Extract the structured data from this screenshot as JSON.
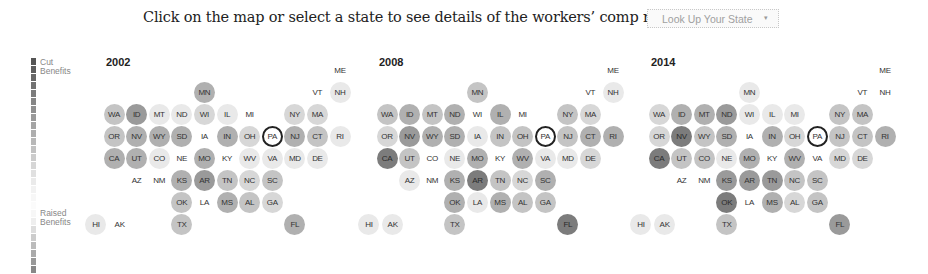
{
  "prompt": {
    "text": "Click on the map or select a state to see details of the workers’ comp reforms:",
    "select_label": "Look Up Your State",
    "select_arrow": "▾"
  },
  "legend": {
    "top_label": "Cut Benefits",
    "bottom_label": "Raised Benefits",
    "segments": [
      "#555",
      "#5e5e5e",
      "#686868",
      "#727272",
      "#7c7c7c",
      "#868686",
      "#909090",
      "#9a9a9a",
      "#a4a4a4",
      "#aeaeae",
      "#b8b8b8",
      "#c2c2c2",
      "#cccccc",
      "#d6d6d6",
      "#e0e0e0",
      "#eaeaea",
      "#f2f2f2",
      "#f7f7f7",
      "#fbfbfb",
      "#f7f7f7",
      "#eeeeee",
      "#dddddd",
      "#cccccc",
      "#bbbbbb",
      "#aaaaaa",
      "#999999",
      "#888888"
    ]
  },
  "shades": [
    "#ffffff",
    "#e9e9e9",
    "#d7d7d7",
    "#c4c4c4",
    "#b0b0b0",
    "#9a9a9a",
    "#7c7c7c",
    "#5f5f5f"
  ],
  "selected_state": "PA",
  "chart_data": {
    "type": "heatmap",
    "legend": {
      "low": "Cut Benefits",
      "high": "Raised Benefits"
    },
    "scale_note": "shade 0 = no change/light, higher = darker (larger change)",
    "layout": [
      {
        "state": "ME",
        "col": 10,
        "row": 0
      },
      {
        "state": "MN",
        "col": 4,
        "row": 1
      },
      {
        "state": "VT",
        "col": 9,
        "row": 1
      },
      {
        "state": "NH",
        "col": 10,
        "row": 1
      },
      {
        "state": "WA",
        "col": 0,
        "row": 2
      },
      {
        "state": "ID",
        "col": 1,
        "row": 2
      },
      {
        "state": "MT",
        "col": 2,
        "row": 2
      },
      {
        "state": "ND",
        "col": 3,
        "row": 2
      },
      {
        "state": "WI",
        "col": 4,
        "row": 2
      },
      {
        "state": "IL",
        "col": 5,
        "row": 2
      },
      {
        "state": "MI",
        "col": 6,
        "row": 2
      },
      {
        "state": "NY",
        "col": 8,
        "row": 2
      },
      {
        "state": "MA",
        "col": 9,
        "row": 2
      },
      {
        "state": "OR",
        "col": 0,
        "row": 3
      },
      {
        "state": "NV",
        "col": 1,
        "row": 3
      },
      {
        "state": "WY",
        "col": 2,
        "row": 3
      },
      {
        "state": "SD",
        "col": 3,
        "row": 3
      },
      {
        "state": "IA",
        "col": 4,
        "row": 3
      },
      {
        "state": "IN",
        "col": 5,
        "row": 3
      },
      {
        "state": "OH",
        "col": 6,
        "row": 3
      },
      {
        "state": "PA",
        "col": 7,
        "row": 3
      },
      {
        "state": "NJ",
        "col": 8,
        "row": 3
      },
      {
        "state": "CT",
        "col": 9,
        "row": 3
      },
      {
        "state": "RI",
        "col": 10,
        "row": 3
      },
      {
        "state": "CA",
        "col": 0,
        "row": 4
      },
      {
        "state": "UT",
        "col": 1,
        "row": 4
      },
      {
        "state": "CO",
        "col": 2,
        "row": 4
      },
      {
        "state": "NE",
        "col": 3,
        "row": 4
      },
      {
        "state": "MO",
        "col": 4,
        "row": 4
      },
      {
        "state": "KY",
        "col": 5,
        "row": 4
      },
      {
        "state": "WV",
        "col": 6,
        "row": 4
      },
      {
        "state": "VA",
        "col": 7,
        "row": 4
      },
      {
        "state": "MD",
        "col": 8,
        "row": 4
      },
      {
        "state": "DE",
        "col": 9,
        "row": 4
      },
      {
        "state": "AZ",
        "col": 1,
        "row": 5
      },
      {
        "state": "NM",
        "col": 2,
        "row": 5
      },
      {
        "state": "KS",
        "col": 3,
        "row": 5
      },
      {
        "state": "AR",
        "col": 4,
        "row": 5
      },
      {
        "state": "TN",
        "col": 5,
        "row": 5
      },
      {
        "state": "NC",
        "col": 6,
        "row": 5
      },
      {
        "state": "SC",
        "col": 7,
        "row": 5
      },
      {
        "state": "OK",
        "col": 3,
        "row": 6
      },
      {
        "state": "LA",
        "col": 4,
        "row": 6
      },
      {
        "state": "MS",
        "col": 5,
        "row": 6
      },
      {
        "state": "AL",
        "col": 6,
        "row": 6
      },
      {
        "state": "GA",
        "col": 7,
        "row": 6
      },
      {
        "state": "HI",
        "col": -0.8,
        "row": 7
      },
      {
        "state": "AK",
        "col": 0.25,
        "row": 7
      },
      {
        "state": "TX",
        "col": 3,
        "row": 7
      },
      {
        "state": "FL",
        "col": 8,
        "row": 7
      }
    ],
    "years": [
      {
        "year": "2002",
        "values": {
          "ME": 0,
          "MN": 4,
          "VT": 0,
          "NH": 1,
          "WA": 3,
          "ID": 5,
          "MT": 1,
          "ND": 1,
          "WI": 2,
          "IL": 1,
          "MI": 0,
          "NY": 2,
          "MA": 2,
          "OR": 3,
          "NV": 4,
          "WY": 4,
          "SD": 4,
          "IA": 0,
          "IN": 4,
          "OH": 2,
          "PA": 0,
          "NJ": 4,
          "CT": 3,
          "RI": 1,
          "CA": 4,
          "UT": 4,
          "CO": 1,
          "NE": 0,
          "MO": 4,
          "KY": 0,
          "WV": 1,
          "VA": 1,
          "MD": 1,
          "DE": 1,
          "AZ": 0,
          "NM": 0,
          "KS": 4,
          "AR": 5,
          "TN": 3,
          "NC": 2,
          "SC": 3,
          "OK": 3,
          "LA": 0,
          "MS": 4,
          "AL": 3,
          "GA": 2,
          "HI": 1,
          "AK": 0,
          "TX": 3,
          "FL": 4
        }
      },
      {
        "year": "2008",
        "values": {
          "ME": 0,
          "MN": 3,
          "VT": 0,
          "NH": 1,
          "WA": 3,
          "ID": 4,
          "MT": 3,
          "ND": 4,
          "WI": 0,
          "IL": 4,
          "MI": 0,
          "NY": 3,
          "MA": 2,
          "OR": 2,
          "NV": 5,
          "WY": 4,
          "SD": 4,
          "IA": 1,
          "IN": 3,
          "OH": 3,
          "PA": 0,
          "NJ": 3,
          "CT": 4,
          "RI": 4,
          "CA": 6,
          "UT": 3,
          "CO": 0,
          "NE": 1,
          "MO": 4,
          "KY": 0,
          "WV": 4,
          "VA": 1,
          "MD": 1,
          "DE": 2,
          "AZ": 1,
          "NM": 0,
          "KS": 4,
          "AR": 6,
          "TN": 3,
          "NC": 2,
          "SC": 4,
          "OK": 4,
          "LA": 1,
          "MS": 4,
          "AL": 3,
          "GA": 3,
          "HI": 1,
          "AK": 1,
          "TX": 3,
          "FL": 6
        }
      },
      {
        "year": "2014",
        "values": {
          "ME": 0,
          "MN": 1,
          "VT": 0,
          "NH": 0,
          "WA": 2,
          "ID": 4,
          "MT": 4,
          "ND": 5,
          "WI": 1,
          "IL": 1,
          "MI": 1,
          "NY": 3,
          "MA": 3,
          "OR": 2,
          "NV": 6,
          "WY": 3,
          "SD": 4,
          "IA": 0,
          "IN": 4,
          "OH": 2,
          "PA": 0,
          "NJ": 3,
          "CT": 3,
          "RI": 4,
          "CA": 6,
          "UT": 3,
          "CO": 3,
          "NE": 1,
          "MO": 4,
          "KY": 0,
          "WV": 4,
          "VA": 0,
          "MD": 2,
          "DE": 2,
          "AZ": 0,
          "NM": 0,
          "KS": 5,
          "AR": 5,
          "TN": 5,
          "NC": 3,
          "SC": 3,
          "OK": 6,
          "LA": 0,
          "MS": 4,
          "AL": 2,
          "GA": 3,
          "HI": 1,
          "AK": 1,
          "TX": 3,
          "FL": 5
        }
      }
    ]
  },
  "maps": [
    {
      "year": "2002",
      "origin_x": 114
    },
    {
      "year": "2008",
      "origin_x": 387
    },
    {
      "year": "2014",
      "origin_x": 659
    }
  ]
}
